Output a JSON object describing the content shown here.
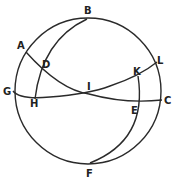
{
  "figure": {
    "type": "spherical-geometry-diagram",
    "stroke_color": "#2a2a2a",
    "background": "#ffffff",
    "points": [
      {
        "label": "A",
        "x": 26,
        "y": 52,
        "lx": 17,
        "ly": 49
      },
      {
        "label": "B",
        "x": 87,
        "y": 19,
        "lx": 84,
        "ly": 14
      },
      {
        "label": "C",
        "x": 162,
        "y": 100,
        "lx": 164,
        "ly": 104
      },
      {
        "label": "D",
        "x": 40,
        "y": 67,
        "lx": 42,
        "ly": 68
      },
      {
        "label": "E",
        "x": 140,
        "y": 104,
        "lx": 131,
        "ly": 114
      },
      {
        "label": "F",
        "x": 90,
        "y": 163,
        "lx": 86,
        "ly": 177
      },
      {
        "label": "G",
        "x": 13,
        "y": 91,
        "lx": 3,
        "ly": 95
      },
      {
        "label": "H",
        "x": 35,
        "y": 98,
        "lx": 30,
        "ly": 107
      },
      {
        "label": "I",
        "x": 89,
        "y": 94,
        "lx": 87,
        "ly": 90
      },
      {
        "label": "K",
        "x": 138,
        "y": 76,
        "lx": 133,
        "ly": 75
      },
      {
        "label": "L",
        "x": 157,
        "y": 62,
        "lx": 157,
        "ly": 64
      }
    ],
    "curves": [
      {
        "name": "outer-circle",
        "through": [
          "B",
          "L",
          "C",
          "F",
          "G",
          "A"
        ]
      },
      {
        "name": "arc-BDH",
        "through": [
          "B",
          "D",
          "H"
        ]
      },
      {
        "name": "arc-KEF",
        "through": [
          "K",
          "E",
          "F"
        ]
      },
      {
        "name": "arc-ADIEC",
        "through": [
          "A",
          "D",
          "I",
          "E",
          "C"
        ]
      },
      {
        "name": "arc-GHIKL",
        "through": [
          "G",
          "H",
          "I",
          "K",
          "L"
        ]
      }
    ]
  }
}
